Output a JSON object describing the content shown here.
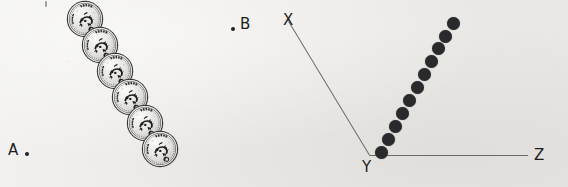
{
  "page": {
    "background_color": "#efeeec",
    "ink_color": "#1d1d1d",
    "line_color": "#6a6a68",
    "dot_color": "#2a2a2c",
    "width": 568,
    "height": 187
  },
  "left_figure": {
    "name": "coin-chain-figure",
    "description": "Six identical coins arranged in a straight diagonal chain between point A and point B",
    "points": [
      {
        "id": "A",
        "label": "A",
        "label_x": 8,
        "label_y": 143,
        "dot_x": 25,
        "dot_y": 152,
        "dot_side": "right"
      },
      {
        "id": "B",
        "label": "B",
        "label_x": 240,
        "label_y": 17,
        "dot_x": 231,
        "dot_y": 27,
        "dot_side": "left"
      }
    ],
    "coin": {
      "count": 6,
      "diameter_px": 34,
      "denomination": "1",
      "inscription_top": "INDIA",
      "inscription_left": "भारत",
      "emblem": "lion-capital-and-horse",
      "material_tone": "silver"
    },
    "coins": [
      {
        "index": 1,
        "x": 68,
        "y": 2
      },
      {
        "index": 2,
        "x": 83,
        "y": 28
      },
      {
        "index": 3,
        "x": 98,
        "y": 54
      },
      {
        "index": 4,
        "x": 113,
        "y": 80
      },
      {
        "index": 5,
        "x": 128,
        "y": 106
      },
      {
        "index": 6,
        "x": 143,
        "y": 132
      }
    ],
    "stray_mark": {
      "x": 45,
      "y": 1
    }
  },
  "right_figure": {
    "name": "angle-xyz-figure",
    "description": "Angle XYZ with vertex at Y; a chain of eleven dots rises from the vertex between ray YX and ray YZ",
    "vertex": {
      "id": "Y",
      "label": "Y",
      "x": 370,
      "y": 155,
      "label_x": 362,
      "label_y": 160
    },
    "rays": [
      {
        "id": "YX",
        "label": "X",
        "end_x": 289,
        "end_y": 21,
        "label_x": 283,
        "label_y": 13
      },
      {
        "id": "YZ",
        "label": "Z",
        "end_x": 528,
        "end_y": 155,
        "label_x": 534,
        "label_y": 148
      }
    ],
    "dot_chain": {
      "count": 11,
      "diameter_px": 13,
      "dots": [
        {
          "index": 1,
          "x": 381,
          "y": 152
        },
        {
          "index": 2,
          "x": 388,
          "y": 139
        },
        {
          "index": 3,
          "x": 395,
          "y": 126
        },
        {
          "index": 4,
          "x": 402,
          "y": 113
        },
        {
          "index": 5,
          "x": 409,
          "y": 100
        },
        {
          "index": 6,
          "x": 417,
          "y": 87
        },
        {
          "index": 7,
          "x": 424,
          "y": 74
        },
        {
          "index": 8,
          "x": 431,
          "y": 61
        },
        {
          "index": 9,
          "x": 438,
          "y": 48
        },
        {
          "index": 10,
          "x": 445,
          "y": 36
        },
        {
          "index": 11,
          "x": 453,
          "y": 23
        }
      ]
    }
  }
}
